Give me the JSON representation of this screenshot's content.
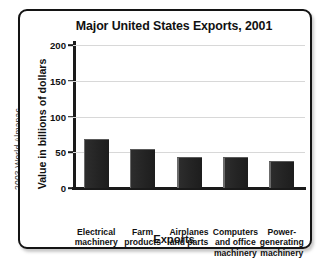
{
  "source_credit": "2003 World Almanac",
  "chart_data": {
    "type": "bar",
    "title": "Major United States Exports, 2001",
    "xlabel": "Exports",
    "ylabel": "Value in billions of dollars",
    "categories": [
      "Electrical machinery",
      "Farm products",
      "Airplanes and parts",
      "Computers and office machinery",
      "Power-generating machinery"
    ],
    "category_lines": [
      [
        "Electrical",
        "machinery"
      ],
      [
        "Farm",
        "products"
      ],
      [
        "Airplanes",
        "and parts"
      ],
      [
        "Computers",
        "and office",
        "machinery"
      ],
      [
        "Power-",
        "generating",
        "machinery"
      ]
    ],
    "values": [
      69,
      54,
      44,
      43,
      38
    ],
    "ylim": [
      0,
      200
    ],
    "yticks": [
      0,
      50,
      100,
      150,
      200
    ],
    "ytick_labels": [
      "0",
      "50",
      "100",
      "150",
      "200"
    ],
    "grid": true,
    "legend": false,
    "bar_color": "#242424",
    "grid_color": "#d8d8d8",
    "axis_color": "#1a1a1a"
  }
}
